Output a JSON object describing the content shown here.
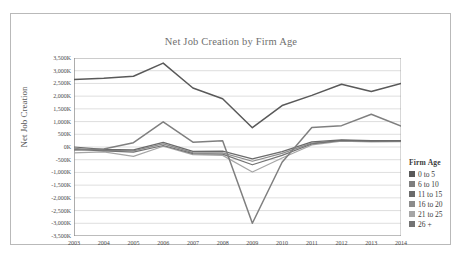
{
  "chart_data": {
    "type": "line",
    "title": "Net Job Creation by Firm Age",
    "xlabel": "",
    "ylabel": "Net Job Creation",
    "grid": true,
    "legend_position": "right",
    "legend_title": "Firm Age",
    "categories": [
      "2003",
      "2004",
      "2005",
      "2006",
      "2007",
      "2008",
      "2009",
      "2010",
      "2011",
      "2012",
      "2013",
      "2014"
    ],
    "x": [
      2003,
      2004,
      2005,
      2006,
      2007,
      2008,
      2009,
      2010,
      2011,
      2012,
      2013,
      2014
    ],
    "ylim": [
      -3500,
      3500
    ],
    "ytick_labels": [
      "3,500K",
      "3,000K",
      "2,500K",
      "2,000K",
      "1,500K",
      "1,000K",
      "500K",
      "0K",
      "-500K",
      "-1,000K",
      "-1,500K",
      "-2,000K",
      "-2,500K",
      "-3,000K",
      "-3,500K"
    ],
    "ytick_values": [
      3500,
      3000,
      2500,
      2000,
      1500,
      1000,
      500,
      0,
      -500,
      -1000,
      -1500,
      -2000,
      -2500,
      -3000,
      -3500
    ],
    "unit": "K",
    "series": [
      {
        "name": "0 to 5",
        "color": "#595959",
        "values": [
          2650,
          2700,
          2780,
          3300,
          2320,
          1900,
          760,
          1630,
          2030,
          2470,
          2180,
          2500
        ]
      },
      {
        "name": "6 to 10",
        "color": "#7f7f7f",
        "values": [
          -120,
          -80,
          170,
          990,
          190,
          250,
          -3000,
          -600,
          770,
          840,
          1290,
          820
        ]
      },
      {
        "name": "11 to 15",
        "color": "#6b6b6b",
        "values": [
          0,
          -90,
          -110,
          180,
          -170,
          -160,
          -470,
          -180,
          200,
          280,
          250,
          250
        ]
      },
      {
        "name": "16 to 20",
        "color": "#8c8c8c",
        "values": [
          -50,
          -130,
          -150,
          120,
          -220,
          -230,
          -560,
          -250,
          150,
          250,
          220,
          230
        ]
      },
      {
        "name": "21 to 25",
        "color": "#a6a6a6",
        "values": [
          -230,
          -190,
          -370,
          30,
          -300,
          -330,
          -980,
          -430,
          80,
          230,
          200,
          210
        ]
      },
      {
        "name": "26 +",
        "color": "#737373",
        "values": [
          -90,
          -150,
          -200,
          60,
          -260,
          -280,
          -700,
          -330,
          120,
          260,
          230,
          240
        ]
      }
    ]
  },
  "legend": {
    "title": "Firm Age",
    "items": [
      {
        "label": "0 to 5",
        "color": "#595959"
      },
      {
        "label": "6 to 10",
        "color": "#7f7f7f"
      },
      {
        "label": "11 to 15",
        "color": "#6b6b6b"
      },
      {
        "label": "16 to 20",
        "color": "#8c8c8c"
      },
      {
        "label": "21 to 25",
        "color": "#a6a6a6"
      },
      {
        "label": "26 +",
        "color": "#737373"
      }
    ]
  },
  "style": {
    "grid_color": "#c8c8c8",
    "axis_color": "#9a9a9a",
    "frame_color": "#b9b9b9",
    "title_color": "#6f6f6f",
    "tick_color": "#4a4a4a",
    "background": "#ffffff"
  }
}
